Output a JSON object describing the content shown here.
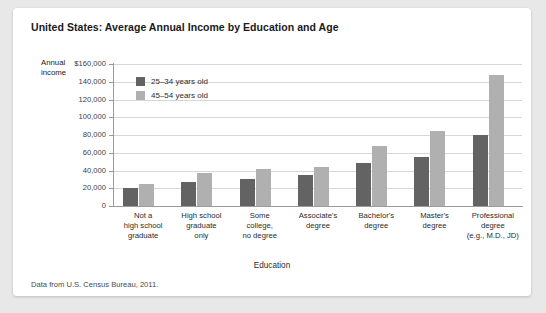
{
  "card": {
    "title": "United States: Average Annual Income by Education and Age",
    "source_note": "Data from U.S. Census Bureau, 2011."
  },
  "chart_data": {
    "type": "bar",
    "title": "United States: Average Annual Income by Education and Age",
    "xlabel": "Education",
    "ylabel": "Annual income",
    "ylim": [
      0,
      160000
    ],
    "ytick_labels": [
      "$160,000",
      "140,000",
      "120,000",
      "100,000",
      "80,000",
      "60,000",
      "40,000",
      "20,000",
      "0"
    ],
    "ytick_values": [
      160000,
      140000,
      120000,
      100000,
      80000,
      60000,
      40000,
      20000,
      0
    ],
    "grid": true,
    "legend_position": "upper left inside plot",
    "categories": [
      "Not a high school graduate",
      "High school graduate only",
      "Some college, no degree",
      "Associate's degree",
      "Bachelor's degree",
      "Master's degree",
      "Professional degree (e.g., M.D., JD)"
    ],
    "category_lines": [
      [
        "Not a",
        "high school",
        "graduate"
      ],
      [
        "High school",
        "graduate",
        "only"
      ],
      [
        "Some",
        "college,",
        "no degree"
      ],
      [
        "Associate's",
        "degree"
      ],
      [
        "Bachelor's",
        "degree"
      ],
      [
        "Master's",
        "degree"
      ],
      [
        "Professional",
        "degree",
        "(e.g., M.D., JD)"
      ]
    ],
    "series": [
      {
        "name": "25–34 years old",
        "color": "#636363",
        "values": [
          20000,
          27000,
          31000,
          35000,
          48000,
          55000,
          80000
        ]
      },
      {
        "name": "45–54 years old",
        "color": "#b0b0b0",
        "values": [
          25000,
          37000,
          42000,
          44000,
          68000,
          84000,
          148000
        ]
      }
    ]
  }
}
